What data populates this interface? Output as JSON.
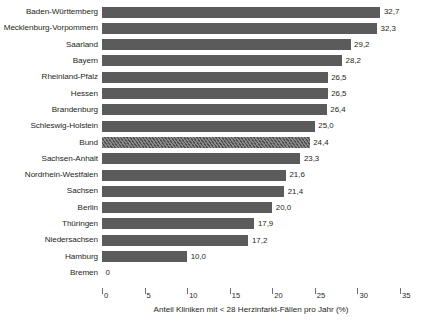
{
  "chart_data": {
    "type": "bar",
    "orientation": "horizontal",
    "title": "",
    "xlabel": "Anteil Kliniken mit < 28 Herzinfarkt-Fällen pro Jahr (%)",
    "ylabel": "",
    "xlim": [
      0,
      35
    ],
    "grid": false,
    "legend": null,
    "decimal_separator": ",",
    "xticks": [
      {
        "value": 0,
        "label": "0"
      },
      {
        "value": 5,
        "label": "5"
      },
      {
        "value": 10,
        "label": "10"
      },
      {
        "value": 15,
        "label": "15"
      },
      {
        "value": 20,
        "label": "20"
      },
      {
        "value": 25,
        "label": "25"
      },
      {
        "value": 30,
        "label": "30"
      },
      {
        "value": 35,
        "label": "35"
      }
    ],
    "categories": [
      "Baden-Württemberg",
      "Mecklenburg-Vorpommern",
      "Saarland",
      "Bayern",
      "Rheinland-Pfalz",
      "Hessen",
      "Brandenburg",
      "Schleswig-Holstein",
      "Bund",
      "Sachsen-Anhalt",
      "Nordrhein-Westfalen",
      "Sachsen",
      "Berlin",
      "Thüringen",
      "Niedersachsen",
      "Hamburg",
      "Bremen"
    ],
    "values": [
      32.7,
      32.3,
      29.2,
      28.2,
      26.5,
      26.5,
      26.4,
      25.0,
      24.4,
      23.3,
      21.6,
      21.4,
      20.0,
      17.9,
      17.2,
      10.0,
      0
    ],
    "value_labels": [
      "32,7",
      "32,3",
      "29,2",
      "28,2",
      "26,5",
      "26,5",
      "26,4",
      "25,0",
      "24,4",
      "23,3",
      "21,6",
      "21,4",
      "20,0",
      "17,9",
      "17,2",
      "10,0",
      "0"
    ],
    "highlight_index": 8,
    "highlight_style": "diagonal-hatch",
    "colors": {
      "bar": "#5b5b5b",
      "bar_highlight": "#6a6a6a",
      "text": "#231f20",
      "axis": "#6d6e71",
      "background": "#ffffff"
    },
    "bars": [
      {
        "category": "Baden-Württemberg",
        "value": 32.7,
        "label": "32,7",
        "highlight": false
      },
      {
        "category": "Mecklenburg-Vorpommern",
        "value": 32.3,
        "label": "32,3",
        "highlight": false
      },
      {
        "category": "Saarland",
        "value": 29.2,
        "label": "29,2",
        "highlight": false
      },
      {
        "category": "Bayern",
        "value": 28.2,
        "label": "28,2",
        "highlight": false
      },
      {
        "category": "Rheinland-Pfalz",
        "value": 26.5,
        "label": "26,5",
        "highlight": false
      },
      {
        "category": "Hessen",
        "value": 26.5,
        "label": "26,5",
        "highlight": false
      },
      {
        "category": "Brandenburg",
        "value": 26.4,
        "label": "26,4",
        "highlight": false
      },
      {
        "category": "Schleswig-Holstein",
        "value": 25.0,
        "label": "25,0",
        "highlight": false
      },
      {
        "category": "Bund",
        "value": 24.4,
        "label": "24,4",
        "highlight": true
      },
      {
        "category": "Sachsen-Anhalt",
        "value": 23.3,
        "label": "23,3",
        "highlight": false
      },
      {
        "category": "Nordrhein-Westfalen",
        "value": 21.6,
        "label": "21,6",
        "highlight": false
      },
      {
        "category": "Sachsen",
        "value": 21.4,
        "label": "21,4",
        "highlight": false
      },
      {
        "category": "Berlin",
        "value": 20.0,
        "label": "20,0",
        "highlight": false
      },
      {
        "category": "Thüringen",
        "value": 17.9,
        "label": "17,9",
        "highlight": false
      },
      {
        "category": "Niedersachsen",
        "value": 17.2,
        "label": "17,2",
        "highlight": false
      },
      {
        "category": "Hamburg",
        "value": 10.0,
        "label": "10,0",
        "highlight": false
      },
      {
        "category": "Bremen",
        "value": 0,
        "label": "0",
        "highlight": false
      }
    ]
  }
}
